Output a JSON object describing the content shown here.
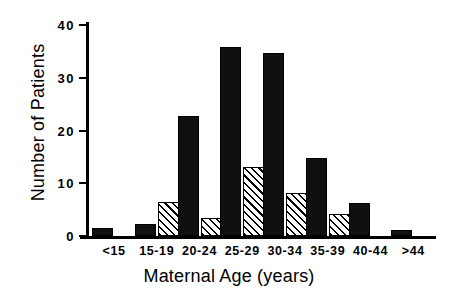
{
  "chart_data": {
    "type": "bar",
    "title": "",
    "xlabel": "Maternal Age (years)",
    "ylabel": "Number of Patients",
    "categories": [
      "<15",
      "15-19",
      "20-24",
      "25-29",
      "30-34",
      "35-39",
      "40-44",
      ">44"
    ],
    "series": [
      {
        "name": "solid",
        "fill": "solid-black",
        "values": [
          1.5,
          2.3,
          22.7,
          35.8,
          34.7,
          14.8,
          6.3,
          1.1
        ]
      },
      {
        "name": "hatched",
        "fill": "diagonal-hatch",
        "values": [
          0,
          6.4,
          3.4,
          13.0,
          8.1,
          4.2,
          0,
          0
        ]
      }
    ],
    "ylim": [
      0,
      40
    ],
    "yticks": [
      0,
      10,
      20,
      30,
      40
    ],
    "ytick_labels": [
      "0",
      "10",
      "20",
      "30",
      "40"
    ],
    "grid": false,
    "legend": "none",
    "colors": {
      "axis": "#000000",
      "solid_bar": "#101010",
      "hatch_bar_background": "#ffffff",
      "hatch_bar_lines": "#000000",
      "background": "#ffffff"
    }
  }
}
